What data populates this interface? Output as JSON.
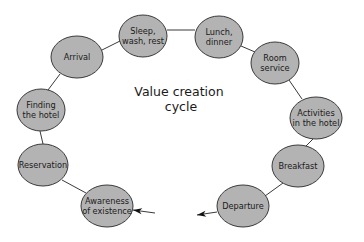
{
  "diagram": {
    "title_lines": [
      "Value creation",
      "cycle"
    ],
    "nodes": [
      {
        "id": "sleep",
        "lines": [
          "Sleep,",
          "wash, rest"
        ],
        "cx": 143,
        "cy": 36,
        "rx": 24,
        "ry": 21
      },
      {
        "id": "lunch",
        "lines": [
          "Lunch,",
          "dinner"
        ],
        "cx": 219,
        "cy": 37,
        "rx": 24,
        "ry": 21
      },
      {
        "id": "arrival",
        "lines": [
          "Arrival"
        ],
        "cx": 77,
        "cy": 57,
        "rx": 26,
        "ry": 21
      },
      {
        "id": "room-service",
        "lines": [
          "Room",
          "service"
        ],
        "cx": 275,
        "cy": 63,
        "rx": 24,
        "ry": 21
      },
      {
        "id": "finding-hotel",
        "lines": [
          "Finding",
          "the hotel"
        ],
        "cx": 41,
        "cy": 110,
        "rx": 24,
        "ry": 21
      },
      {
        "id": "activities",
        "lines": [
          "Activities",
          "in the hotel"
        ],
        "cx": 316,
        "cy": 118,
        "rx": 26,
        "ry": 21
      },
      {
        "id": "reservation",
        "lines": [
          "Reservation"
        ],
        "cx": 43,
        "cy": 165,
        "rx": 25,
        "ry": 21
      },
      {
        "id": "breakfast",
        "lines": [
          "Breakfast"
        ],
        "cx": 298,
        "cy": 166,
        "rx": 26,
        "ry": 21
      },
      {
        "id": "awareness",
        "lines": [
          "Awareness",
          "of existence"
        ],
        "cx": 107,
        "cy": 206,
        "rx": 26,
        "ry": 21
      },
      {
        "id": "departure",
        "lines": [
          "Departure"
        ],
        "cx": 243,
        "cy": 206,
        "rx": 26,
        "ry": 21
      }
    ],
    "edges": [
      {
        "from": "reservation",
        "to": "awareness",
        "x1": 62,
        "y1": 180,
        "x2": 86,
        "y2": 193
      },
      {
        "from": "finding-hotel",
        "to": "reservation",
        "x1": 40,
        "y1": 131,
        "x2": 43,
        "y2": 144
      },
      {
        "from": "arrival",
        "to": "finding-hotel",
        "x1": 60,
        "y1": 74,
        "x2": 48,
        "y2": 90
      },
      {
        "from": "arrival",
        "to": "sleep",
        "x1": 102,
        "y1": 50,
        "x2": 120,
        "y2": 41
      },
      {
        "from": "sleep",
        "to": "lunch",
        "x1": 167,
        "y1": 30,
        "x2": 195,
        "y2": 30
      },
      {
        "from": "lunch",
        "to": "room-service",
        "x1": 241,
        "y1": 46,
        "x2": 255,
        "y2": 52
      },
      {
        "from": "room-service",
        "to": "activities",
        "x1": 289,
        "y1": 80,
        "x2": 302,
        "y2": 99
      },
      {
        "from": "activities",
        "to": "breakfast",
        "x1": 313,
        "y1": 139,
        "x2": 306,
        "y2": 146
      },
      {
        "from": "breakfast",
        "to": "departure",
        "x1": 283,
        "y1": 183,
        "x2": 265,
        "y2": 196
      }
    ],
    "arrows": [
      {
        "id": "arrow-into-awareness",
        "x1": 155,
        "y1": 213,
        "x2": 133,
        "y2": 210
      },
      {
        "id": "arrow-out-of-departure",
        "x1": 217,
        "y1": 212,
        "x2": 197,
        "y2": 215
      }
    ],
    "colors": {
      "node_fill": "#b3b3b3",
      "node_stroke": "#3a3a3a",
      "text": "#1a1a1a"
    }
  }
}
